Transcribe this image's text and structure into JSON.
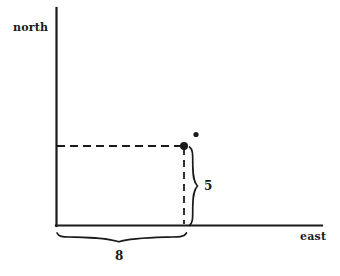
{
  "figure": {
    "title": "",
    "background_color": "#ffffff",
    "ink_color": "#1a1a1a",
    "axes": {
      "y_axis_label": "north",
      "x_axis_label": "east",
      "origin": {
        "x": 56,
        "y": 225
      },
      "y_axis_top": {
        "x": 56,
        "y": 8
      },
      "x_axis_right": {
        "x": 322,
        "y": 225
      }
    },
    "point": {
      "marker": "filled-dot",
      "x": 184,
      "y": 146,
      "east_value": 8,
      "north_value": 5
    },
    "star_marker": {
      "glyph": "asterisk",
      "x": 196,
      "y": 135
    },
    "guides": [
      {
        "name": "horizontal-guide",
        "style": "dashed",
        "from": {
          "x": 56,
          "y": 146
        },
        "to": {
          "x": 184,
          "y": 146
        }
      },
      {
        "name": "vertical-guide",
        "style": "dashed",
        "from": {
          "x": 184,
          "y": 146
        },
        "to": {
          "x": 184,
          "y": 225
        }
      }
    ],
    "measurements": [
      {
        "name": "vertical-measure",
        "label": "5",
        "orientation": "vertical",
        "brace_from": {
          "x": 192,
          "y": 146
        },
        "brace_to": {
          "x": 192,
          "y": 226
        },
        "label_position": {
          "x": 207,
          "y": 186
        }
      },
      {
        "name": "horizontal-measure",
        "label": "8",
        "orientation": "horizontal",
        "brace_from": {
          "x": 56,
          "y": 236
        },
        "brace_to": {
          "x": 187,
          "y": 236
        },
        "label_position": {
          "x": 120,
          "y": 257
        }
      }
    ]
  }
}
